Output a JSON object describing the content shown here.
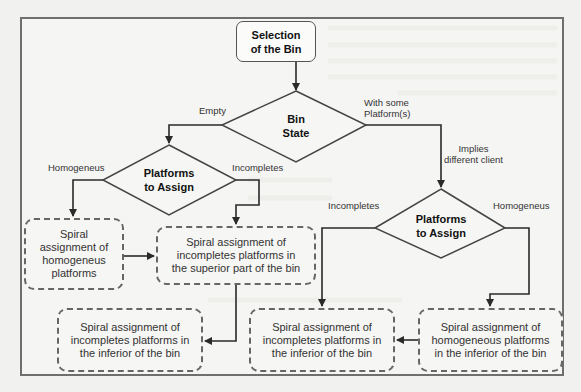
{
  "diagram": {
    "type": "flowchart",
    "start_node": {
      "text": "Selection of the Bin",
      "line1": "Selection",
      "line2": "of the Bin"
    },
    "decisions": {
      "bin_state": {
        "line1": "Bin",
        "line2": "State"
      },
      "platforms_left": {
        "line1": "Platforms",
        "line2": "to Assign"
      },
      "platforms_right": {
        "line1": "Platforms",
        "line2": "to Assign"
      }
    },
    "processes": {
      "spiral_homogeneous": {
        "lines": [
          "Spiral",
          "assignment of",
          "homogeneus",
          "platforms"
        ]
      },
      "spiral_incompletes_superior": {
        "lines": [
          "Spiral assignment of",
          "incompletes platforms in",
          "the superior part of the bin"
        ]
      },
      "spiral_incompletes_inferior_left": {
        "lines": [
          "Spiral assignment of",
          "incompletes platforms in",
          "the inferior of the bin"
        ]
      },
      "spiral_incompletes_inferior_mid": {
        "lines": [
          "Spiral assignment of",
          "incompletes platforms in",
          "the inferior of the bin"
        ]
      },
      "spiral_homogeneous_inferior": {
        "lines": [
          "Spiral assignment of",
          "homogeneous platforms",
          "in the inferior of the bin"
        ]
      }
    },
    "edge_labels": {
      "empty": "Empty",
      "with_some_line1": "With some",
      "with_some_line2": "Platform(s)",
      "implies_line1": "Implies",
      "implies_line2": "different client",
      "homogeneus_left": "Homogeneus",
      "incompletes_left": "Incompletes",
      "incompletes_right": "Incompletes",
      "homogeneus_right": "Homogeneus"
    },
    "edges": [
      {
        "from": "Selection of the Bin",
        "to": "Bin State"
      },
      {
        "from": "Bin State",
        "to": "Platforms to Assign (left)",
        "label": "Empty"
      },
      {
        "from": "Bin State",
        "to": "Platforms to Assign (right)",
        "label": "With some Platform(s) / Implies different client"
      },
      {
        "from": "Platforms to Assign (left)",
        "to": "Spiral assignment of homogeneus platforms",
        "label": "Homogeneus"
      },
      {
        "from": "Platforms to Assign (left)",
        "to": "Spiral assignment of incompletes platforms in the superior part of the bin",
        "label": "Incompletes"
      },
      {
        "from": "Spiral assignment of homogeneus platforms",
        "to": "Spiral assignment of incompletes platforms in the superior part of the bin"
      },
      {
        "from": "Spiral assignment of incompletes platforms in the superior part of the bin",
        "to": "Spiral assignment of incompletes platforms in the inferior of the bin (left)"
      },
      {
        "from": "Platforms to Assign (right)",
        "to": "Spiral assignment of incompletes platforms in the inferior of the bin (mid)",
        "label": "Incompletes"
      },
      {
        "from": "Platforms to Assign (right)",
        "to": "Spiral assignment of homogeneous platforms in the inferior of the bin",
        "label": "Homogeneus"
      },
      {
        "from": "Spiral assignment of homogeneous platforms in the inferior of the bin",
        "to": "Spiral assignment of incompletes platforms in the inferior of the bin (mid)"
      }
    ],
    "colors": {
      "line": "#2a2a2a",
      "frame": "#6f6f6f",
      "background": "#f1f1ef"
    }
  }
}
